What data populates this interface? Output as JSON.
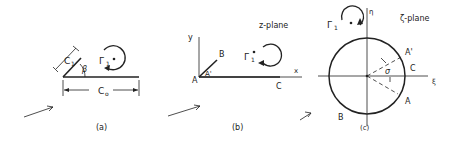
{
  "figure": {
    "panels": [
      {
        "id": "a",
        "caption": "(a)",
        "labels": {
          "chord_main": "C",
          "chord_main_sub": "o",
          "chord_flap": "C",
          "chord_flap_sub": "1",
          "angle": "β",
          "circulation": "Γ",
          "circulation_sub": "1"
        }
      },
      {
        "id": "b",
        "caption": "(b)",
        "plane_label": "z-plane",
        "labels": {
          "y_axis": "y",
          "x_axis": "x",
          "point_A": "A",
          "point_A_prime": "A'",
          "point_B": "B",
          "point_C": "C",
          "circulation": "Γ",
          "circulation_sub": "1"
        }
      },
      {
        "id": "c",
        "caption": "(c)",
        "plane_label": "ζ-plane",
        "labels": {
          "eta_axis": "η",
          "xi_axis": "ξ",
          "point_A": "A",
          "point_A_prime": "A'",
          "point_B": "B",
          "point_C": "C",
          "angle": "σ",
          "circulation": "Γ",
          "circulation_sub": "1"
        }
      }
    ],
    "colors": {
      "ink": "#222222",
      "background": "#ffffff"
    }
  }
}
